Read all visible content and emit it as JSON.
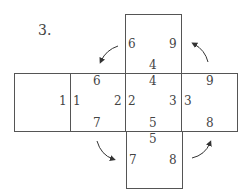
{
  "problem_number": "3.",
  "faces": {
    "top": {
      "labels": [
        "6",
        "9",
        "4"
      ]
    },
    "far_left": {
      "labels": [
        "1"
      ]
    },
    "left": {
      "labels": [
        "6",
        "1",
        "2",
        "7"
      ]
    },
    "center": {
      "labels": [
        "4",
        "2",
        "3",
        "5"
      ]
    },
    "right": {
      "labels": [
        "9",
        "3",
        "8"
      ]
    },
    "bottom": {
      "labels": [
        "5",
        "7",
        "8"
      ]
    }
  }
}
